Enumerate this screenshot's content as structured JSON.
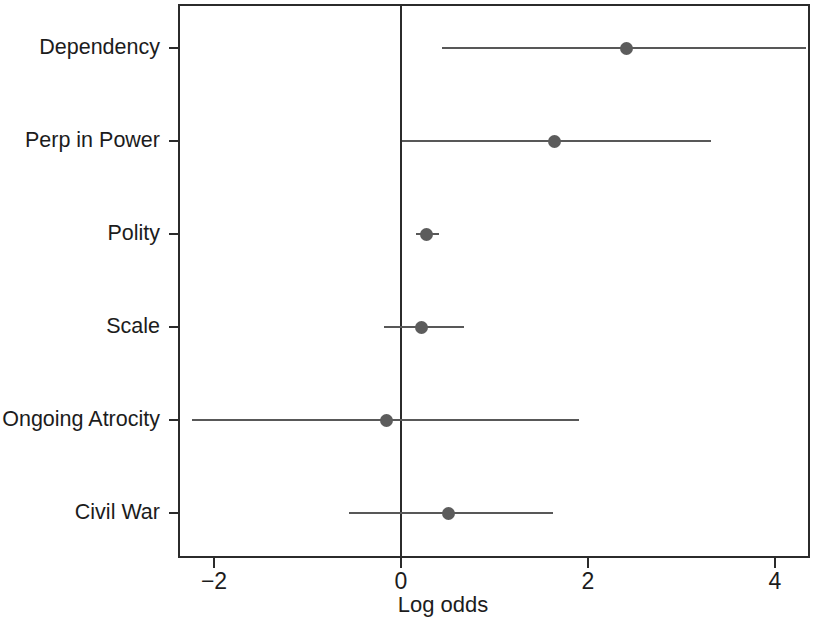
{
  "chart_data": {
    "type": "scatter",
    "subtype": "forest-plot",
    "title": "",
    "xlabel": "Log odds",
    "ylabel": "",
    "xlim": [
      -2.38,
      4.39
    ],
    "ylim": [
      0,
      6
    ],
    "grid": false,
    "legend": null,
    "zero_reference_line": 0,
    "xticks": [
      -2,
      0,
      2,
      4
    ],
    "xticklabels": [
      "−2",
      "0",
      "2",
      "4"
    ],
    "categories": [
      "Dependency",
      "Perp in Power",
      "Polity",
      "Scale",
      "Ongoing Atrocity",
      "Civil War"
    ],
    "point_color": "#5c5c5c",
    "line_color": "#585858",
    "axis_color": "#2b2b2b",
    "points": [
      {
        "label": "Dependency",
        "estimate": 2.41,
        "ci_low": 0.44,
        "ci_high": 4.33
      },
      {
        "label": "Perp in Power",
        "estimate": 1.64,
        "ci_low": 0.01,
        "ci_high": 3.32
      },
      {
        "label": "Polity",
        "estimate": 0.27,
        "ci_low": 0.16,
        "ci_high": 0.41
      },
      {
        "label": "Scale",
        "estimate": 0.22,
        "ci_low": -0.18,
        "ci_high": 0.67
      },
      {
        "label": "Ongoing Atrocity",
        "estimate": -0.16,
        "ci_low": -2.24,
        "ci_high": 1.9
      },
      {
        "label": "Civil War",
        "estimate": 0.51,
        "ci_low": -0.56,
        "ci_high": 1.63
      }
    ]
  }
}
